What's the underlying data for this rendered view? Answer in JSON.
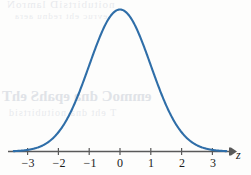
{
  "figure": {
    "name": "standard-normal-curve",
    "background_color": "#fdfdfc",
    "curve_color": "#2f6ea8",
    "axis_color": "#595959",
    "label_color": "#1a1a1a",
    "axis_variable": "z"
  },
  "ghost_text": {
    "line_1": "noitubirtsiD lamroN",
    "line_2": "evruc eht rednu aera",
    "line_3": "emmoC dna epahS ehT",
    "line_4": "T eht dna noitubirtsid"
  },
  "chart_data": {
    "type": "line",
    "title": "",
    "subtitle": "",
    "xlabel": "z",
    "ylabel": "",
    "xlim": [
      -3.45,
      3.45
    ],
    "ylim": [
      0,
      0.44
    ],
    "grid": false,
    "legend": null,
    "annotations": [],
    "xticks": [
      -3,
      -2,
      -1,
      0,
      1,
      2,
      3
    ],
    "xticklabels": [
      "−3",
      "−2",
      "−1",
      "0",
      "1",
      "2",
      "3"
    ],
    "yticks": [],
    "yticklabels": [],
    "series": [
      {
        "name": "standard normal density",
        "formula": "phi(z) = (1/sqrt(2*pi)) * exp(-z^2/2)",
        "mean": 0,
        "sd": 1,
        "x": [
          -3.4,
          -3.2,
          -3.0,
          -2.8,
          -2.6,
          -2.4,
          -2.2,
          -2.0,
          -1.8,
          -1.6,
          -1.4,
          -1.2,
          -1.0,
          -0.8,
          -0.6,
          -0.4,
          -0.2,
          0.0,
          0.2,
          0.4,
          0.6,
          0.8,
          1.0,
          1.2,
          1.4,
          1.6,
          1.8,
          2.0,
          2.2,
          2.4,
          2.6,
          2.8,
          3.0,
          3.2,
          3.4
        ],
        "y": [
          0.001,
          0.002,
          0.004,
          0.008,
          0.014,
          0.022,
          0.035,
          0.054,
          0.079,
          0.111,
          0.15,
          0.194,
          0.242,
          0.29,
          0.333,
          0.368,
          0.391,
          0.399,
          0.391,
          0.368,
          0.333,
          0.29,
          0.242,
          0.194,
          0.15,
          0.111,
          0.079,
          0.054,
          0.035,
          0.022,
          0.014,
          0.008,
          0.004,
          0.002,
          0.001
        ]
      }
    ]
  }
}
